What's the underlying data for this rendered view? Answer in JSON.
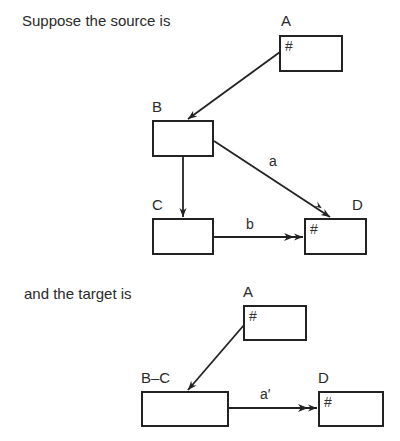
{
  "source": {
    "caption": "Suppose the source is",
    "nodes": {
      "A": {
        "label": "A",
        "marker": "#"
      },
      "B": {
        "label": "B",
        "marker": ""
      },
      "C": {
        "label": "C",
        "marker": ""
      },
      "D": {
        "label": "D",
        "marker": "#"
      }
    },
    "edges": [
      {
        "from": "A",
        "to": "B",
        "label": "",
        "arrowheads": 1
      },
      {
        "from": "B",
        "to": "C",
        "label": "",
        "arrowheads": 1
      },
      {
        "from": "B",
        "to": "D",
        "label": "a",
        "arrowheads": 2
      },
      {
        "from": "C",
        "to": "D",
        "label": "b",
        "arrowheads": 2
      }
    ]
  },
  "target": {
    "caption": "and the target is",
    "nodes": {
      "A": {
        "label": "A",
        "marker": "#"
      },
      "BC": {
        "label": "B–C",
        "marker": ""
      },
      "D": {
        "label": "D",
        "marker": "#"
      }
    },
    "edges": [
      {
        "from": "A",
        "to": "B-C",
        "label": "",
        "arrowheads": 1
      },
      {
        "from": "B-C",
        "to": "D",
        "label": "a′",
        "arrowheads": 2
      }
    ]
  }
}
